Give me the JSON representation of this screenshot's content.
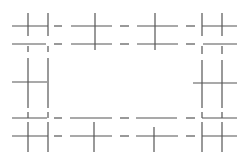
{
  "diagram": {
    "line_color": "#555555",
    "background": "#ffffff",
    "rows": [
      "top-outer",
      "top-inner",
      "middle",
      "bottom-inner",
      "bottom-outer"
    ],
    "columns": [
      "left",
      "center-left",
      "center-right",
      "right"
    ],
    "connector_style": "dashed"
  }
}
